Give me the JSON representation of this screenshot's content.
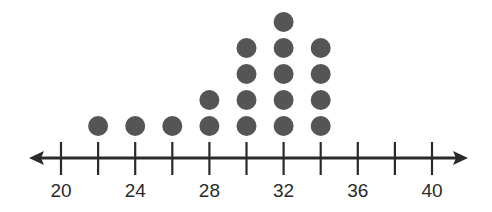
{
  "chart_data": {
    "type": "dot_plot",
    "title": "",
    "xlabel": "",
    "ylabel": "",
    "x_range": [
      20,
      40
    ],
    "tick_step": 2,
    "tick_labels": [
      "20",
      "24",
      "28",
      "32",
      "36",
      "40"
    ],
    "tick_label_values": [
      20,
      24,
      28,
      32,
      36,
      40
    ],
    "minor_ticks": [
      22,
      26,
      30,
      34,
      38
    ],
    "categories": [
      22,
      24,
      26,
      28,
      30,
      32,
      34
    ],
    "values": [
      1,
      1,
      1,
      2,
      4,
      5,
      4
    ],
    "total_dots": 18,
    "axis_arrows": "both",
    "grid": false,
    "legend": null
  },
  "colors": {
    "dot": "#555555",
    "axis": "#2a2a2a",
    "background": "#ffffff"
  }
}
